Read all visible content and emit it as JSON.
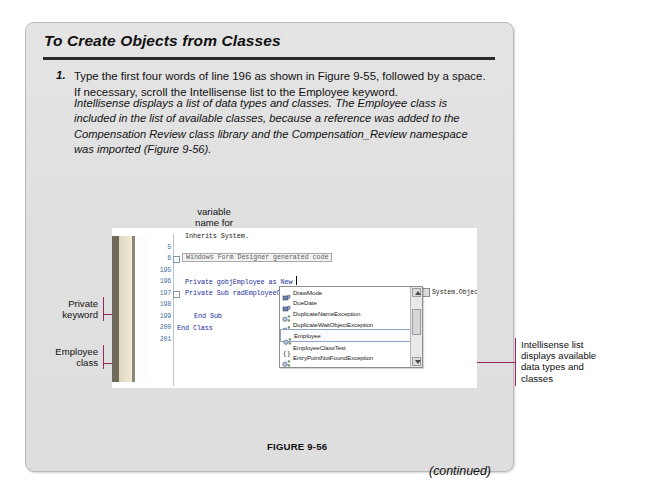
{
  "card": {
    "title": "To Create Objects from Classes",
    "step": {
      "number": "1.",
      "text": "Type the first four words of line 196 as shown in Figure 9-55, followed by a space. If necessary, scroll the Intellisense list to the Employee keyword."
    },
    "note": "Intellisense displays a list of data types and classes. The Employee class is included in the list of available classes, because a reference was added to the Compensation Review class library and the Compensation_Review namespace was imported (Figure 9-56).",
    "figure_caption": "FIGURE 9-56",
    "continued": "(continued)"
  },
  "callouts": {
    "variable_name": "variable\nname for\nEmployee\nobject",
    "variable_name_lines": [
      "variable",
      "name for",
      "Employee",
      "object"
    ],
    "new_keyword_lines": [
      "New",
      "keyword"
    ],
    "private_keyword_lines": [
      "Private",
      "keyword"
    ],
    "employee_class_lines": [
      "Employee",
      "class"
    ],
    "intellisense_lines": [
      "Intellisense list",
      "displays available",
      "data types and",
      "classes"
    ],
    "rule_color": "#96285f"
  },
  "editor": {
    "lines": [
      {
        "num": "",
        "text": "Inherits System."
      },
      {
        "num": "5",
        "text": ""
      },
      {
        "num": "6",
        "text": ""
      },
      {
        "num": "195",
        "text": ""
      },
      {
        "num": "196",
        "text": "Private gobjEmployee as New "
      },
      {
        "num": "197",
        "text": "Private Sub radEmployeeOb"
      },
      {
        "num": "198",
        "text": ""
      },
      {
        "num": "199",
        "text": "End Sub"
      },
      {
        "num": "200",
        "text": "End Class"
      },
      {
        "num": "201",
        "text": ""
      }
    ],
    "region_label": "Windows Form Designer generated code",
    "tooltip": "System.Objec"
  },
  "intellisense": {
    "items": [
      {
        "label": "DrawMode",
        "icon": "enum-member-icon",
        "selected": false
      },
      {
        "label": "DueDate",
        "icon": "enum-member-icon",
        "selected": false
      },
      {
        "label": "DuplicateNameException",
        "icon": "class-icon",
        "selected": false
      },
      {
        "label": "DuplicateWaitObjectException",
        "icon": "class-icon",
        "selected": false
      },
      {
        "label": "Employee",
        "icon": "class-icon",
        "selected": true
      },
      {
        "label": "EmployeeClassTest",
        "icon": "namespace-icon",
        "selected": false
      },
      {
        "label": "EntryPointNotFoundException",
        "icon": "class-icon",
        "selected": false
      },
      {
        "label": "EntryWrittenEventArgs",
        "icon": "class-icon",
        "selected": false
      },
      {
        "label": "EntryWrittenEventHandler",
        "icon": "delegate-icon",
        "selected": false
      },
      {
        "label": "Enum",
        "icon": "class-icon",
        "selected": false
      }
    ]
  },
  "colors": {
    "card_bg": "#e2e2e2",
    "rule_accent": "#96285f",
    "code_keyword": "#1c2fa0",
    "line_number": "#3f6f9f"
  }
}
